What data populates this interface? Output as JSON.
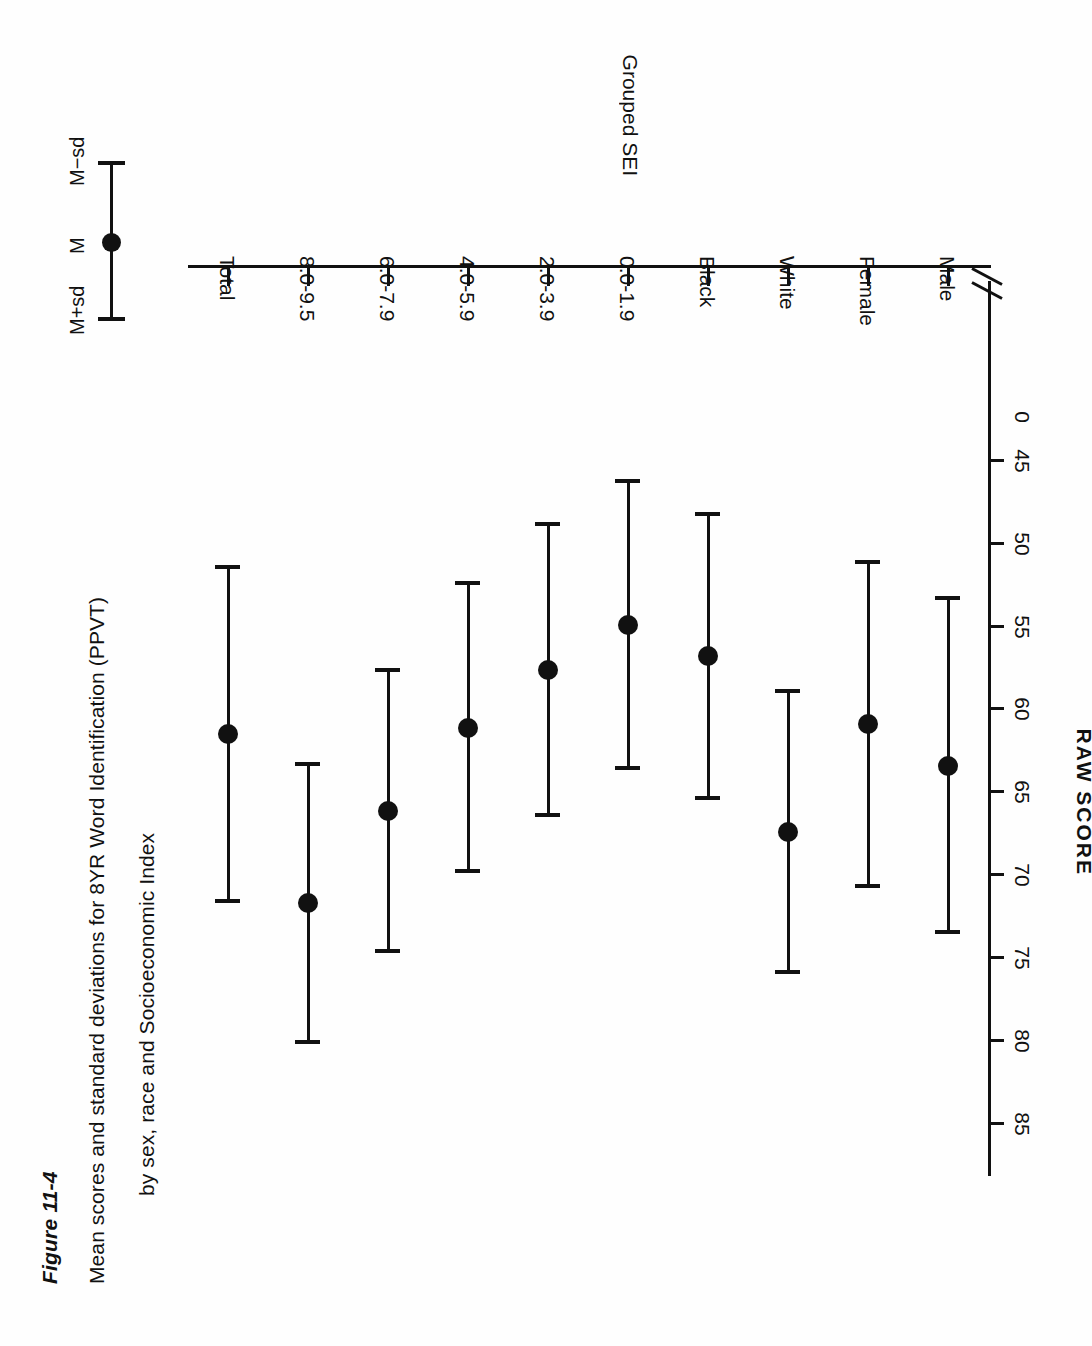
{
  "figure": {
    "number": "Figure 11-4",
    "caption_line1": "Mean scores and standard deviations for 8YR Word Identification (PPVT)",
    "caption_line2": "by sex, race and Socioeconomic Index"
  },
  "legend": {
    "upper_label": "M+sd",
    "mean_label": "M",
    "lower_label": "M−sd"
  },
  "chart_data": {
    "type": "scatter",
    "title": "Mean scores and standard deviations for 8YR Word Identification (PPVT) by sex, race and Socioeconomic Index",
    "orientation": "horizontal-error-bars",
    "xlabel": "Grouped SEI",
    "ylabel": "RAW SCORE",
    "ylim": [
      45,
      85
    ],
    "y_ticks": [
      85,
      80,
      75,
      70,
      65,
      60,
      55,
      50,
      45
    ],
    "y_tick_labels": [
      "85",
      "80",
      "75",
      "70",
      "65",
      "60",
      "55",
      "50",
      "45"
    ],
    "axis_break": true,
    "axis_break_label": "0",
    "grid": false,
    "legend_position": "top-right",
    "categories": [
      "Male",
      "Female",
      "White",
      "Black",
      "0.0-1.9",
      "2.0-3.9",
      "4.0-5.9",
      "6.0-7.9",
      "8.0-9.5",
      "Total"
    ],
    "series": [
      {
        "name": "Mean",
        "values": [
          63.4,
          60.9,
          67.4,
          56.8,
          54.9,
          57.6,
          61.1,
          66.1,
          71.7,
          61.5
        ]
      },
      {
        "name": "SD",
        "values": [
          10.1,
          9.8,
          8.5,
          8.6,
          8.7,
          8.8,
          8.7,
          8.5,
          8.4,
          10.1
        ]
      }
    ],
    "points": [
      {
        "category": "Male",
        "mean": 63.4,
        "sd": 10.1,
        "upper": 73.5,
        "lower": 53.3
      },
      {
        "category": "Female",
        "mean": 60.9,
        "sd": 9.8,
        "upper": 70.7,
        "lower": 51.1
      },
      {
        "category": "White",
        "mean": 67.4,
        "sd": 8.5,
        "upper": 75.9,
        "lower": 58.9
      },
      {
        "category": "Black",
        "mean": 56.8,
        "sd": 8.6,
        "upper": 65.4,
        "lower": 48.2
      },
      {
        "category": "0.0-1.9",
        "mean": 54.9,
        "sd": 8.7,
        "upper": 63.6,
        "lower": 46.2
      },
      {
        "category": "2.0-3.9",
        "mean": 57.6,
        "sd": 8.8,
        "upper": 66.4,
        "lower": 48.8
      },
      {
        "category": "4.0-5.9",
        "mean": 61.1,
        "sd": 8.7,
        "upper": 69.8,
        "lower": 52.4
      },
      {
        "category": "6.0-7.9",
        "mean": 66.1,
        "sd": 8.5,
        "upper": 74.6,
        "lower": 57.6
      },
      {
        "category": "8.0-9.5",
        "mean": 71.7,
        "sd": 8.4,
        "upper": 80.1,
        "lower": 63.3
      },
      {
        "category": "Total",
        "mean": 61.5,
        "sd": 10.1,
        "upper": 71.6,
        "lower": 51.4
      }
    ]
  },
  "colors": {
    "ink": "#111111",
    "paper": "#fefefe"
  }
}
